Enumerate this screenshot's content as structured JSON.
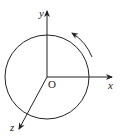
{
  "diagram": {
    "type": "rotating-disk-coordinate-system",
    "labels": {
      "y_axis": "y",
      "x_axis": "x",
      "z_axis": "z",
      "origin": "O"
    },
    "rotation_direction": "counterclockwise",
    "colors": {
      "stroke": "#222222",
      "background": "#ffffff"
    }
  }
}
